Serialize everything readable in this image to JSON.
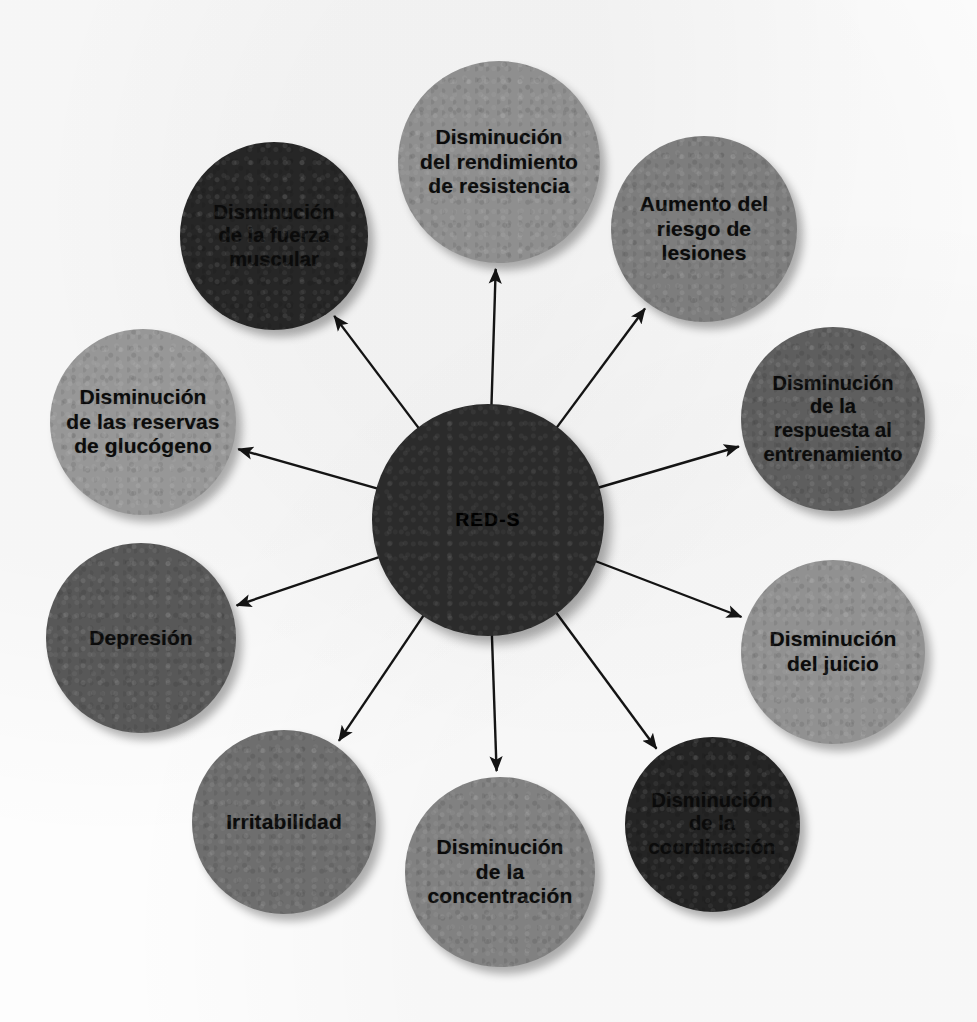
{
  "diagram": {
    "type": "radial-hub-and-spoke",
    "title_text": "",
    "background_color": "#fdfdfd",
    "canvas": {
      "width": 977,
      "height": 1022
    },
    "hub": {
      "label": "RED-S",
      "center_x": 488,
      "center_y": 520,
      "diameter": 232,
      "fill": "#2b2b2b",
      "text_color": "#000000",
      "font_size": 19
    },
    "edge_style": {
      "color": "#141414",
      "width": 2.4,
      "arrowhead": "solid-triangle"
    },
    "nodes": [
      {
        "id": "rendimiento-resistencia",
        "label": "Disminución del rendimiento de resistencia",
        "lines": [
          "Disminución",
          "del rendimiento",
          "de resistencia"
        ],
        "center_x": 499,
        "center_y": 162,
        "diameter": 202,
        "fill": "#8f8f8f",
        "font_size": 21,
        "angle_deg": 270
      },
      {
        "id": "riesgo-lesiones",
        "label": "Aumento del riesgo de lesiones",
        "lines": [
          "Aumento del",
          "riesgo de",
          "lesiones"
        ],
        "center_x": 704,
        "center_y": 229,
        "diameter": 186,
        "fill": "#7d7d7d",
        "font_size": 21,
        "angle_deg": 305
      },
      {
        "id": "respuesta-entrenamiento",
        "label": "Disminución de la respuesta al entrenamiento",
        "lines": [
          "Disminución",
          "de la",
          "respuesta al",
          "entrenamiento"
        ],
        "center_x": 833,
        "center_y": 419,
        "diameter": 184,
        "fill": "#5e5e5e",
        "font_size": 20,
        "angle_deg": 341
      },
      {
        "id": "juicio",
        "label": "Disminución del juicio",
        "lines": [
          "Disminución",
          "del juicio"
        ],
        "center_x": 833,
        "center_y": 652,
        "diameter": 184,
        "fill": "#919191",
        "font_size": 21,
        "angle_deg": 19
      },
      {
        "id": "coordinacion",
        "label": "Disminución de la coordinación",
        "lines": [
          "Disminución",
          "de la",
          "coordinación"
        ],
        "center_x": 712,
        "center_y": 824,
        "diameter": 175,
        "fill": "#242424",
        "font_size": 20,
        "angle_deg": 54
      },
      {
        "id": "concentracion",
        "label": "Disminución de la concentración",
        "lines": [
          "Disminución",
          "de la",
          "concentración"
        ],
        "center_x": 500,
        "center_y": 872,
        "diameter": 190,
        "fill": "#818181",
        "font_size": 21,
        "angle_deg": 90
      },
      {
        "id": "irritabilidad",
        "label": "Irritabilidad",
        "lines": [
          "Irritabilidad"
        ],
        "center_x": 284,
        "center_y": 822,
        "diameter": 184,
        "fill": "#6e6e6e",
        "font_size": 21,
        "angle_deg": 125
      },
      {
        "id": "depresion",
        "label": "Depresión",
        "lines": [
          "Depresión"
        ],
        "center_x": 141,
        "center_y": 638,
        "diameter": 190,
        "fill": "#585858",
        "font_size": 21,
        "angle_deg": 160
      },
      {
        "id": "reservas-glucogeno",
        "label": "Disminución de las reservas de glucógeno",
        "lines": [
          "Disminución",
          "de las reservas",
          "de glucógeno"
        ],
        "center_x": 143,
        "center_y": 422,
        "diameter": 186,
        "fill": "#979797",
        "font_size": 21,
        "angle_deg": 199
      },
      {
        "id": "fuerza-muscular",
        "label": "Disminución de la fuerza muscular",
        "lines": [
          "Disminución",
          "de la fuerza",
          "muscular"
        ],
        "center_x": 274,
        "center_y": 236,
        "diameter": 188,
        "fill": "#262626",
        "font_size": 20,
        "angle_deg": 235
      }
    ]
  }
}
